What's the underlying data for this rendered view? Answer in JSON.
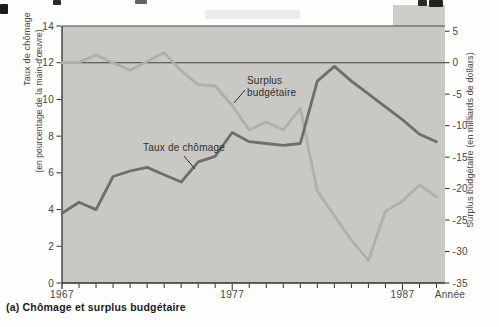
{
  "figure": {
    "caption": "(a) Chômage et surplus budgétaire"
  },
  "colors": {
    "panel": "#c9c8c4",
    "unemployment_line": "#6e6e6e",
    "surplus_line": "#b1afab",
    "axis": "#2e2e2e",
    "zero_line": "#3c3c3c",
    "tick_text": "#464646",
    "caption_text": "#1b1b1b"
  },
  "chart_data": {
    "type": "line",
    "title": "",
    "x": [
      1967,
      1968,
      1969,
      1970,
      1971,
      1972,
      1973,
      1974,
      1975,
      1976,
      1977,
      1978,
      1979,
      1980,
      1981,
      1982,
      1983,
      1984,
      1985,
      1986,
      1987,
      1988,
      1989
    ],
    "x_axis": {
      "label": "Année",
      "range": [
        1967,
        1989.5
      ],
      "tick_every": 1,
      "major_ticks": [
        1977,
        1987
      ],
      "labeled_ticks": [
        1967,
        1977,
        1987
      ]
    },
    "left_axis": {
      "label": "Taux de chômage",
      "sublabel": "(en pourcentage de la main-d'œuvre)",
      "range": [
        0,
        14
      ],
      "ticks": [
        0,
        2,
        4,
        6,
        8,
        10,
        12,
        14
      ]
    },
    "right_axis": {
      "label": "Surplus budgétaire (en milliards de dollars)",
      "range": [
        -35,
        5
      ],
      "ticks": [
        5,
        0,
        -5,
        -10,
        -15,
        -20,
        -25,
        -30,
        -35
      ],
      "zero_line": 0
    },
    "grid": false,
    "legend": "in-plot annotations",
    "series": [
      {
        "name": "Taux de chômage",
        "axis": "left",
        "color": "#6e6e6e",
        "values": [
          3.8,
          4.4,
          4.0,
          5.8,
          6.1,
          6.3,
          5.9,
          5.5,
          6.6,
          6.9,
          8.2,
          7.7,
          7.6,
          7.5,
          7.6,
          11.0,
          11.8,
          11.0,
          10.3,
          9.6,
          8.9,
          8.1,
          7.7
        ]
      },
      {
        "name": "Surplus budgétaire",
        "axis": "right",
        "color": "#b1afab",
        "values": [
          0,
          0.1,
          1.2,
          0,
          -1.2,
          0.2,
          1.6,
          -1.3,
          -3.5,
          -3.7,
          -6.8,
          -10.7,
          -9.4,
          -10.7,
          -7.3,
          -20.4,
          -24.3,
          -28.2,
          -31.4,
          -23.6,
          -22.0,
          -19.4,
          -21.3
        ]
      }
    ],
    "annotations": [
      {
        "lines": [
          "Surplus",
          "budgétaire"
        ],
        "x": 247,
        "y": 84,
        "pointer": {
          "x1": 234,
          "y1": 103,
          "x2": 245,
          "y2": 90
        }
      },
      {
        "lines": [
          "Taux de chômage"
        ],
        "x": 143,
        "y": 151,
        "pointer": {
          "x1": 184,
          "y1": 156,
          "x2": 195,
          "y2": 169
        }
      }
    ]
  }
}
